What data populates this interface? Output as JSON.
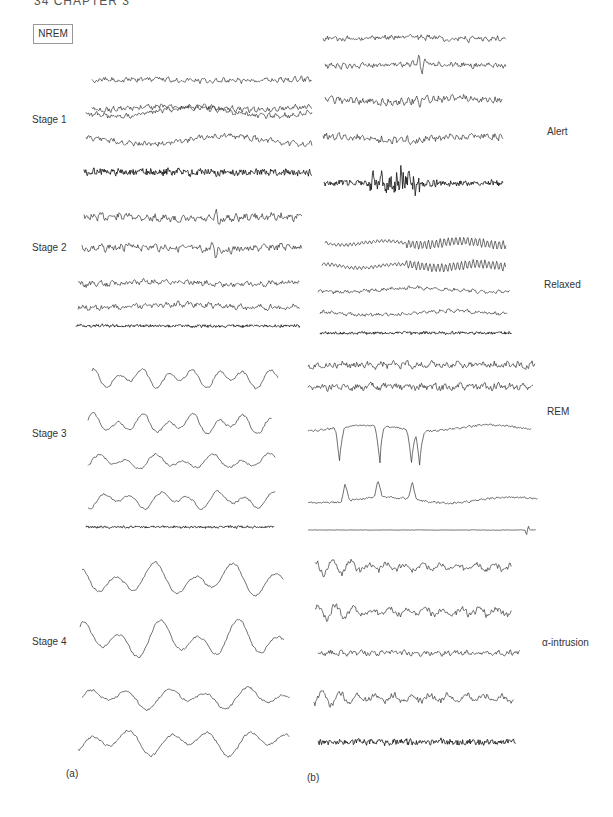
{
  "page": {
    "running_head": "34   CHAPTER 3",
    "nrem_box": "NREM",
    "panel_a_label": "(a)",
    "panel_b_label": "(b)"
  },
  "panel_a": {
    "stages": [
      {
        "label": "Stage 1",
        "label_pos": [
          32,
          120
        ]
      },
      {
        "label": "Stage 2",
        "label_pos": [
          32,
          248
        ]
      },
      {
        "label": "Stage 3",
        "label_pos": [
          32,
          434
        ]
      },
      {
        "label": "Stage 4",
        "label_pos": [
          32,
          642
        ]
      }
    ]
  },
  "panel_b": {
    "states": [
      {
        "label": "Alert",
        "label_pos": [
          547,
          132
        ]
      },
      {
        "label": "Relaxed",
        "label_pos": [
          544,
          285
        ]
      },
      {
        "label": "REM",
        "label_pos": [
          547,
          412
        ]
      },
      {
        "label": "α-intrusion",
        "label_pos": [
          542,
          643
        ]
      }
    ]
  },
  "traces": [
    {
      "group": "Stage 1",
      "x0": 92,
      "x1": 312,
      "y": 80,
      "amp": 3,
      "freq": 0.9,
      "slow": 1.0,
      "type": "eeg",
      "seed": 1
    },
    {
      "group": "Stage 1",
      "x0": 92,
      "x1": 312,
      "y": 108,
      "amp": 3,
      "freq": 0.9,
      "slow": 1.5,
      "type": "eeg",
      "seed": 2
    },
    {
      "group": "Stage 1",
      "x0": 86,
      "x1": 312,
      "y": 112,
      "amp": 3,
      "freq": 0.8,
      "slow": 4,
      "type": "eeg",
      "seed": 3
    },
    {
      "group": "Stage 1",
      "x0": 86,
      "x1": 312,
      "y": 140,
      "amp": 3,
      "freq": 0.8,
      "slow": 4,
      "type": "eeg",
      "seed": 4
    },
    {
      "group": "Stage 1",
      "x0": 84,
      "x1": 312,
      "y": 172,
      "amp": 6,
      "freq": 1.6,
      "slow": 0,
      "type": "emg",
      "seed": 5
    },
    {
      "group": "Stage 2",
      "x0": 84,
      "x1": 302,
      "y": 218,
      "amp": 4,
      "freq": 0.7,
      "slow": 1.5,
      "type": "eeg",
      "seed": 6,
      "spike": 217
    },
    {
      "group": "Stage 2",
      "x0": 82,
      "x1": 302,
      "y": 248,
      "amp": 4,
      "freq": 0.7,
      "slow": 1.5,
      "type": "eeg",
      "seed": 7,
      "spike": 214
    },
    {
      "group": "Stage 2",
      "x0": 78,
      "x1": 300,
      "y": 283,
      "amp": 3,
      "freq": 0.6,
      "slow": 1.5,
      "type": "eeg",
      "seed": 8
    },
    {
      "group": "Stage 2",
      "x0": 78,
      "x1": 300,
      "y": 306,
      "amp": 3,
      "freq": 0.6,
      "slow": 1.5,
      "type": "eeg",
      "seed": 9
    },
    {
      "group": "Stage 2",
      "x0": 76,
      "x1": 300,
      "y": 326,
      "amp": 2.5,
      "freq": 1.6,
      "slow": 0,
      "type": "emg",
      "seed": 10
    },
    {
      "group": "Stage 3",
      "x0": 92,
      "x1": 278,
      "y": 378,
      "amp": 9,
      "freq": 0.25,
      "slow": 0,
      "type": "delta",
      "seed": 11
    },
    {
      "group": "Stage 3",
      "x0": 88,
      "x1": 272,
      "y": 424,
      "amp": 9,
      "freq": 0.25,
      "slow": 0,
      "type": "delta",
      "seed": 12
    },
    {
      "group": "Stage 3",
      "x0": 88,
      "x1": 276,
      "y": 462,
      "amp": 7,
      "freq": 0.22,
      "slow": 0,
      "type": "delta",
      "seed": 13
    },
    {
      "group": "Stage 3",
      "x0": 88,
      "x1": 276,
      "y": 500,
      "amp": 8,
      "freq": 0.22,
      "slow": 0,
      "type": "delta",
      "seed": 14
    },
    {
      "group": "Stage 3",
      "x0": 86,
      "x1": 274,
      "y": 527,
      "amp": 2,
      "freq": 1.6,
      "slow": 0,
      "type": "emg",
      "seed": 15
    },
    {
      "group": "Stage 4",
      "x0": 82,
      "x1": 284,
      "y": 580,
      "amp": 15,
      "freq": 0.16,
      "slow": 0,
      "type": "delta",
      "seed": 16
    },
    {
      "group": "Stage 4",
      "x0": 80,
      "x1": 284,
      "y": 640,
      "amp": 17,
      "freq": 0.16,
      "slow": 0,
      "type": "delta",
      "seed": 17
    },
    {
      "group": "Stage 4",
      "x0": 82,
      "x1": 290,
      "y": 698,
      "amp": 10,
      "freq": 0.16,
      "slow": 0,
      "type": "delta",
      "seed": 18
    },
    {
      "group": "Stage 4",
      "x0": 78,
      "x1": 290,
      "y": 742,
      "amp": 12,
      "freq": 0.16,
      "slow": 0,
      "type": "delta",
      "seed": 19
    },
    {
      "group": "Alert",
      "x0": 323,
      "x1": 506,
      "y": 38,
      "amp": 3,
      "freq": 1.0,
      "slow": 1,
      "type": "eeg",
      "seed": 20
    },
    {
      "group": "Alert",
      "x0": 325,
      "x1": 506,
      "y": 65,
      "amp": 3,
      "freq": 1.0,
      "slow": 1,
      "type": "eeg",
      "seed": 21,
      "spike": 420
    },
    {
      "group": "Alert",
      "x0": 325,
      "x1": 503,
      "y": 100,
      "amp": 4,
      "freq": 1.0,
      "slow": 2,
      "type": "eeg",
      "seed": 22,
      "spike": 418
    },
    {
      "group": "Alert",
      "x0": 323,
      "x1": 503,
      "y": 138,
      "amp": 4,
      "freq": 1.0,
      "slow": 2,
      "type": "eeg",
      "seed": 23
    },
    {
      "group": "Alert",
      "x0": 324,
      "x1": 503,
      "y": 183,
      "amp": 5,
      "freq": 1.6,
      "slow": 0,
      "type": "emg",
      "seed": 24,
      "burst": 395
    },
    {
      "group": "Relaxed",
      "x0": 325,
      "x1": 506,
      "y": 243,
      "amp": 2.5,
      "freq": 0.9,
      "slow": 1,
      "type": "alpha",
      "seed": 25
    },
    {
      "group": "Relaxed",
      "x0": 322,
      "x1": 506,
      "y": 266,
      "amp": 2.5,
      "freq": 0.9,
      "slow": 1,
      "type": "alpha",
      "seed": 26
    },
    {
      "group": "Relaxed",
      "x0": 318,
      "x1": 510,
      "y": 290,
      "amp": 2,
      "freq": 0.7,
      "slow": 2,
      "type": "eeg",
      "seed": 27
    },
    {
      "group": "Relaxed",
      "x0": 320,
      "x1": 508,
      "y": 313,
      "amp": 2,
      "freq": 0.7,
      "slow": 2,
      "type": "eeg",
      "seed": 28
    },
    {
      "group": "Relaxed",
      "x0": 320,
      "x1": 512,
      "y": 333,
      "amp": 2.5,
      "freq": 1.6,
      "slow": 0,
      "type": "emg",
      "seed": 29
    },
    {
      "group": "REM",
      "x0": 308,
      "x1": 535,
      "y": 365,
      "amp": 4,
      "freq": 0.5,
      "slow": 0,
      "type": "eeg",
      "seed": 30
    },
    {
      "group": "REM",
      "x0": 308,
      "x1": 533,
      "y": 387,
      "amp": 4,
      "freq": 0.5,
      "slow": 0,
      "type": "eeg",
      "seed": 31
    },
    {
      "group": "REM",
      "x0": 308,
      "x1": 532,
      "y": 428,
      "amp": 3,
      "freq": 0.4,
      "slow": 0,
      "type": "eog",
      "seed": 32
    },
    {
      "group": "REM",
      "x0": 308,
      "x1": 538,
      "y": 500,
      "amp": 3,
      "freq": 0.4,
      "slow": 0,
      "type": "eog2",
      "seed": 33
    },
    {
      "group": "REM",
      "x0": 308,
      "x1": 536,
      "y": 530,
      "amp": 0.3,
      "freq": 1.0,
      "slow": 0,
      "type": "flat",
      "seed": 34
    },
    {
      "group": "α-intrusion",
      "x0": 315,
      "x1": 512,
      "y": 567,
      "amp": 5,
      "freq": 0.7,
      "slow": 0,
      "type": "mixed",
      "seed": 35
    },
    {
      "group": "α-intrusion",
      "x0": 315,
      "x1": 512,
      "y": 612,
      "amp": 5,
      "freq": 0.7,
      "slow": 0,
      "type": "mixed",
      "seed": 36
    },
    {
      "group": "α-intrusion",
      "x0": 318,
      "x1": 520,
      "y": 653,
      "amp": 3,
      "freq": 0.6,
      "slow": 0,
      "type": "eeg",
      "seed": 37
    },
    {
      "group": "α-intrusion",
      "x0": 314,
      "x1": 514,
      "y": 698,
      "amp": 5,
      "freq": 0.9,
      "slow": 0,
      "type": "mixed",
      "seed": 38
    },
    {
      "group": "α-intrusion",
      "x0": 318,
      "x1": 516,
      "y": 742,
      "amp": 5,
      "freq": 1.6,
      "slow": 0,
      "type": "emg",
      "seed": 39
    }
  ]
}
